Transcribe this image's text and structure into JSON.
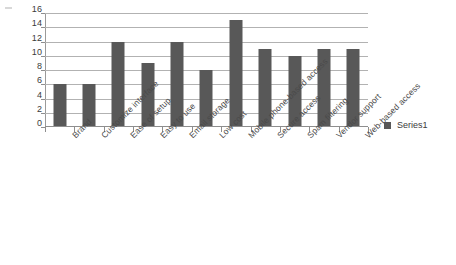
{
  "chart_data": {
    "type": "bar",
    "title": "",
    "subtitle": "",
    "xlabel": "",
    "ylabel": "",
    "ylim": [
      0,
      16
    ],
    "ytick_step": 2,
    "yticks": [
      16,
      14,
      12,
      10,
      8,
      6,
      4,
      2,
      0
    ],
    "grid": true,
    "grid_axis": "y",
    "legend_position": "right",
    "categories": [
      "Brand",
      "Customize interface",
      "Ease of setup",
      "Easy to use",
      "Email storage",
      "Low cost",
      "Mobile phone-based access",
      "Secure access",
      "Spam filtering",
      "Vendor support",
      "Web-based access"
    ],
    "series": [
      {
        "name": "Series1",
        "color": "#585858",
        "values": [
          6,
          6,
          12,
          9,
          12,
          8,
          15,
          11,
          10,
          11,
          11
        ]
      }
    ]
  },
  "legend": {
    "entries": [
      {
        "label": "Series1",
        "swatch_icon": "square-swatch-icon"
      }
    ]
  },
  "colors": {
    "bar": "#585858",
    "gridline": "#b2b2b2",
    "axis": "#8e8e8e",
    "text": "#3b3b3b",
    "category_text": "#4a4a4a",
    "background": "#ffffff"
  }
}
